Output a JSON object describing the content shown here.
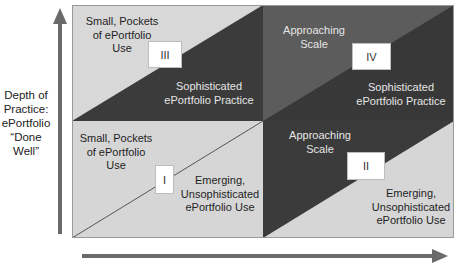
{
  "y_axis": {
    "label_lines": [
      "Depth of",
      "Practice:",
      "ePortfolio",
      "“Done",
      "Well”"
    ],
    "arrow_direction": "up"
  },
  "x_axis": {
    "label": "",
    "arrow_direction": "right"
  },
  "colors": {
    "light": "#d6d6d6",
    "dark": "#3b3b3b",
    "medium_dark": "#5c5c5c",
    "arrow": "#6a6a6a",
    "box": "#ffffff"
  },
  "quadrants": {
    "III": {
      "number": "III",
      "upper_text": [
        "Small, Pockets",
        "of ePortfolio",
        "Use"
      ],
      "lower_text": [
        "Sophisticated",
        "ePortfolio Practice"
      ]
    },
    "IV": {
      "number": "IV",
      "upper_text": [
        "Approaching",
        "Scale"
      ],
      "lower_text": [
        "Sophisticated",
        "ePortfolio Practice"
      ]
    },
    "I": {
      "number": "I",
      "upper_text": [
        "Small, Pockets",
        "of ePortfolio",
        "Use"
      ],
      "lower_text": [
        "Emerging,",
        "Unsophisticated",
        "ePortfolio Use"
      ]
    },
    "II": {
      "number": "II",
      "upper_text": [
        "Approaching",
        "Scale"
      ],
      "lower_text": [
        "Emerging,",
        "Unsophisticated",
        "ePortfolio Use"
      ]
    }
  }
}
